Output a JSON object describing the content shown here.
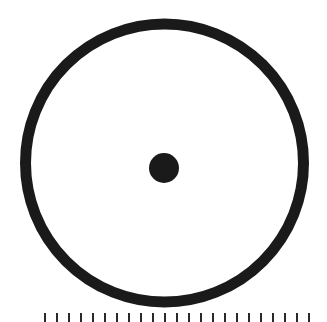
{
  "figure": {
    "type": "circle-with-center-point",
    "colors": {
      "background": "#ffffff",
      "stroke": "#1a1a1a",
      "point": "#1a1a1a"
    },
    "outer_circle": {
      "cx": 164.5,
      "cy": 163,
      "r": 139,
      "stroke_width": 11
    },
    "center_point": {
      "cx": 164,
      "cy": 168,
      "r": 15
    }
  },
  "caption": {
    "visible": "partially cropped (only ascender tops visible, illegible)"
  }
}
